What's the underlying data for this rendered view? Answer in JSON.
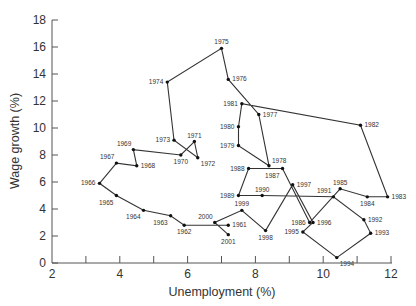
{
  "chart_data": {
    "type": "line",
    "title": "",
    "xlabel": "Unemployment (%)",
    "ylabel": "Wage growth (%)",
    "xlim": [
      2,
      12
    ],
    "ylim": [
      0,
      18
    ],
    "xticks": [
      2,
      4,
      6,
      8,
      10,
      12
    ],
    "yticks": [
      0,
      2,
      4,
      6,
      8,
      10,
      12,
      14,
      16,
      18
    ],
    "grid": false,
    "legend": null,
    "series": [
      {
        "name": "Wage growth vs unemployment (connected scatter by year)",
        "points": [
          {
            "year": "1961",
            "x": 7.2,
            "y": 2.8,
            "label_pos": "right"
          },
          {
            "year": "1962",
            "x": 5.9,
            "y": 2.8,
            "label_pos": "below"
          },
          {
            "year": "1963",
            "x": 5.5,
            "y": 3.5,
            "label_pos": "below-left"
          },
          {
            "year": "1964",
            "x": 4.7,
            "y": 3.9,
            "label_pos": "below-left"
          },
          {
            "year": "1965",
            "x": 3.9,
            "y": 5.0,
            "label_pos": "below-left"
          },
          {
            "year": "1966",
            "x": 3.4,
            "y": 5.9,
            "label_pos": "left"
          },
          {
            "year": "1967",
            "x": 3.9,
            "y": 7.4,
            "label_pos": "above-left"
          },
          {
            "year": "1968",
            "x": 4.5,
            "y": 7.2,
            "label_pos": "right"
          },
          {
            "year": "1969",
            "x": 4.4,
            "y": 8.4,
            "label_pos": "above-left"
          },
          {
            "year": "1970",
            "x": 5.8,
            "y": 8.0,
            "label_pos": "below"
          },
          {
            "year": "1971",
            "x": 6.2,
            "y": 9.0,
            "label_pos": "above"
          },
          {
            "year": "1972",
            "x": 6.3,
            "y": 7.8,
            "label_pos": "right-below"
          },
          {
            "year": "1973",
            "x": 5.6,
            "y": 9.1,
            "label_pos": "left"
          },
          {
            "year": "1974",
            "x": 5.4,
            "y": 13.4,
            "label_pos": "left"
          },
          {
            "year": "1975",
            "x": 7.0,
            "y": 15.9,
            "label_pos": "above"
          },
          {
            "year": "1976",
            "x": 7.2,
            "y": 13.6,
            "label_pos": "right"
          },
          {
            "year": "1977",
            "x": 8.1,
            "y": 11.0,
            "label_pos": "right"
          },
          {
            "year": "1978",
            "x": 8.4,
            "y": 7.2,
            "label_pos": "right-above"
          },
          {
            "year": "1979",
            "x": 7.5,
            "y": 8.7,
            "label_pos": "left"
          },
          {
            "year": "1980",
            "x": 7.5,
            "y": 10.1,
            "label_pos": "left"
          },
          {
            "year": "1981",
            "x": 7.6,
            "y": 11.8,
            "label_pos": "left"
          },
          {
            "year": "1982",
            "x": 11.1,
            "y": 10.2,
            "label_pos": "right"
          },
          {
            "year": "1983",
            "x": 11.9,
            "y": 4.9,
            "label_pos": "right"
          },
          {
            "year": "1984",
            "x": 11.3,
            "y": 4.9,
            "label_pos": "below"
          },
          {
            "year": "1985",
            "x": 10.5,
            "y": 5.5,
            "label_pos": "above"
          },
          {
            "year": "1986",
            "x": 9.6,
            "y": 3.0,
            "label_pos": "left"
          },
          {
            "year": "1987",
            "x": 8.8,
            "y": 7.0,
            "label_pos": "below-left"
          },
          {
            "year": "1988",
            "x": 7.8,
            "y": 7.0,
            "label_pos": "left"
          },
          {
            "year": "1989",
            "x": 7.5,
            "y": 5.0,
            "label_pos": "left"
          },
          {
            "year": "1990",
            "x": 8.2,
            "y": 5.0,
            "label_pos": "above"
          },
          {
            "year": "1991",
            "x": 10.3,
            "y": 4.9,
            "label_pos": "above-left"
          },
          {
            "year": "1992",
            "x": 11.2,
            "y": 3.2,
            "label_pos": "right"
          },
          {
            "year": "1993",
            "x": 11.4,
            "y": 2.2,
            "label_pos": "right"
          },
          {
            "year": "1994",
            "x": 10.4,
            "y": 0.4,
            "label_pos": "right-below"
          },
          {
            "year": "1995",
            "x": 9.4,
            "y": 2.3,
            "label_pos": "left"
          },
          {
            "year": "1996",
            "x": 9.7,
            "y": 3.0,
            "label_pos": "right"
          },
          {
            "year": "1997",
            "x": 9.1,
            "y": 5.8,
            "label_pos": "right"
          },
          {
            "year": "1998",
            "x": 8.3,
            "y": 2.4,
            "label_pos": "below"
          },
          {
            "year": "1999",
            "x": 7.6,
            "y": 3.9,
            "label_pos": "above"
          },
          {
            "year": "2000",
            "x": 6.8,
            "y": 3.0,
            "label_pos": "above-left"
          },
          {
            "year": "2001",
            "x": 7.2,
            "y": 2.1,
            "label_pos": "below"
          }
        ]
      }
    ]
  }
}
